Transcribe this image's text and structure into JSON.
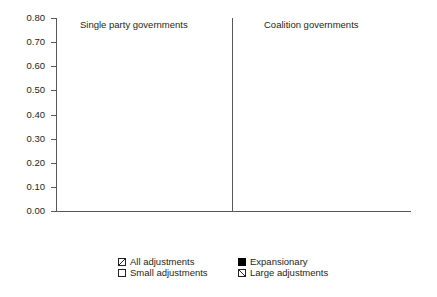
{
  "chart_data": {
    "type": "bar",
    "title": "",
    "xlabel": "",
    "ylabel": "",
    "ylim": [
      0.0,
      0.8
    ],
    "ytick_step": 0.1,
    "grid": false,
    "legend_position": "bottom",
    "panels": [
      {
        "name": "Single party governments",
        "categories": [
          "1 year before",
          "2 years\nbefore",
          "3 years\nbefore"
        ],
        "series": [
          {
            "name": "All adjustments",
            "values": [
              0.563,
              0.465,
              0.355
            ]
          },
          {
            "name": "Expansionary",
            "values": [
              0.588,
              0.565,
              0.5
            ]
          },
          {
            "name": "Small adjustments",
            "values": [
              0.56,
              0.5,
              0.333
            ]
          },
          {
            "name": "Large adjustments",
            "values": [
              0.571,
              0.333,
              0.5
            ]
          }
        ]
      },
      {
        "name": "Coalition governments",
        "categories": [
          "1 year before",
          "2 years\nbefore",
          "3 years\nbefore"
        ],
        "series": [
          {
            "name": "All adjustments",
            "values": [
              0.623,
              0.63,
              0.667
            ]
          },
          {
            "name": "Expansionary",
            "values": [
              0.655,
              0.6,
              0.478
            ]
          },
          {
            "name": "Small adjustments",
            "values": [
              0.658,
              0.585,
              0.65
            ]
          },
          {
            "name": "Large adjustments",
            "values": [
              0.5,
              0.727,
              0.75
            ]
          }
        ]
      }
    ],
    "ytick_labels": [
      "0.80",
      "0.70",
      "0.60",
      "0.50",
      "0.40",
      "0.30",
      "0.20",
      "0.10",
      "0.00"
    ],
    "legend": [
      {
        "label": "All adjustments",
        "pattern": "backslash-hatch"
      },
      {
        "label": "Expansionary",
        "pattern": "solid-black"
      },
      {
        "label": "Small adjustments",
        "pattern": "white-empty"
      },
      {
        "label": "Large adjustments",
        "pattern": "forwardslash-hatch"
      }
    ],
    "colors": {
      "axis": "#58595b",
      "text": "#231f20",
      "hatch": "#6d6e71",
      "fill_solid": "#000000",
      "fill_empty": "#ffffff"
    }
  },
  "axis": {
    "y_labels": [
      "0.80",
      "0.70",
      "0.60",
      "0.50",
      "0.40",
      "0.30",
      "0.20",
      "0.10",
      "0.00"
    ]
  },
  "panel_titles": {
    "left": "Single party governments",
    "right": "Coalition governments"
  },
  "category_labels": {
    "g1": "1 year before",
    "g2": "2 years\nbefore",
    "g3": "3 years\nbefore",
    "g4": "1 year before",
    "g5": "2 years\nbefore",
    "g6": "3 years\nbefore"
  },
  "legend": {
    "all": "All adjustments",
    "expansionary": "Expansionary",
    "small": "Small adjustments",
    "large": "Large adjustments"
  }
}
